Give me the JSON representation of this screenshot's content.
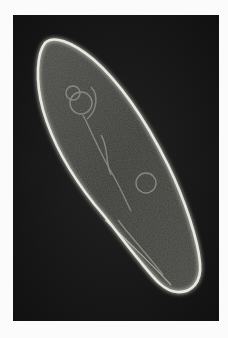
{
  "image": {
    "subject": "paramecium micrograph",
    "description": "Dark-field / phase-contrast micrograph of a single elongated ciliate cell with a bright outline on a black background",
    "colors": {
      "page_background": "#fbfbfb",
      "panel_background": "#141414",
      "cell_outline": "#e8e8e0",
      "cell_interior": "#3a3a36"
    }
  }
}
